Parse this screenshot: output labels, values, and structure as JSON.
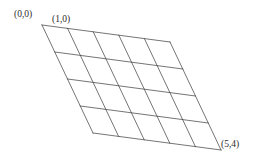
{
  "figure": {
    "type": "lattice-parallelogram-grid",
    "background_color": "#ffffff",
    "line_color": "#3a3a3a",
    "line_width": 0.7,
    "labels": {
      "origin": "(0,0)",
      "unit_u": "(1,0)",
      "far_corner": "(5,4)"
    }
  },
  "grid_data": {
    "type": "mesh",
    "columns": 5,
    "rows": 4,
    "origin": {
      "x": 42,
      "y": 25
    },
    "vector_u": {
      "x": 25.6,
      "y": 3.4
    },
    "vector_v": {
      "x": 12.75,
      "y": 27.0
    },
    "corners": {
      "top_left": {
        "x": 42,
        "y": 25
      },
      "top_right": {
        "x": 170,
        "y": 42
      },
      "bottom_left": {
        "x": 93,
        "y": 133
      },
      "bottom_right": {
        "x": 221,
        "y": 150
      }
    },
    "label_anchors": {
      "origin": {
        "x": 42,
        "y": 25
      },
      "unit_u": {
        "x": 67.6,
        "y": 28.4
      },
      "far_corner": {
        "x": 221,
        "y": 150
      }
    }
  }
}
